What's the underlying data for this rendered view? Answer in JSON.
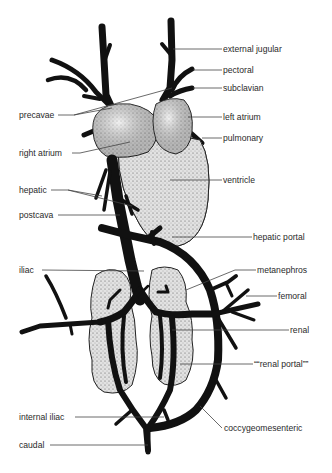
{
  "figure": {
    "type": "anatomical venous system diagram",
    "labels": {
      "external_jugular": "external jugular",
      "pectoral": "pectoral",
      "subclavian": "subclavian",
      "precavae": "precavae",
      "left_atrium": "left atrium",
      "pulmonary": "pulmonary",
      "right_atrium": "right atrium",
      "ventricle": "ventricle",
      "hepatic": "hepatic",
      "postcava": "postcava",
      "hepatic_portal": "hepatic portal",
      "iliac": "iliac",
      "metanephros": "metanephros",
      "femoral": "femoral",
      "renal": "renal",
      "renal_portal": "““renal portal””",
      "internal_iliac": "internal iliac",
      "coccygeomesenteric": "coccygeomesenteric",
      "caudal": "caudal"
    },
    "colors": {
      "vein": "#111111",
      "organ_fill": "#d6d6d6",
      "text": "#2a2a2a"
    }
  }
}
